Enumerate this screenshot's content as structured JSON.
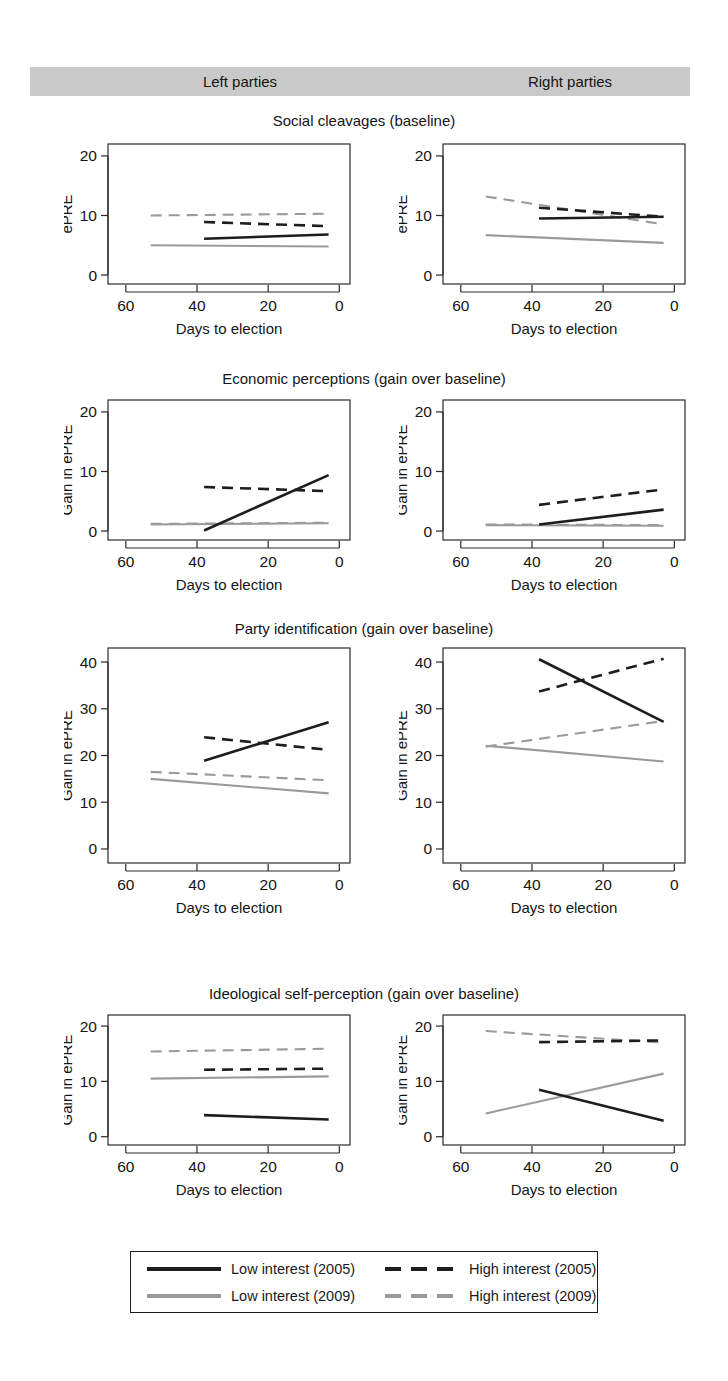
{
  "header": {
    "left_label": "Left parties",
    "right_label": "Right parties",
    "band_color": "#c9c9c9"
  },
  "axis": {
    "xlabel": "Days to election",
    "xticks": [
      "60",
      "40",
      "20",
      "0"
    ],
    "xlim": [
      65,
      -3
    ]
  },
  "legend": {
    "items": [
      {
        "label": "Low interest (2005)",
        "style": "solid",
        "color": "#1d1d1d",
        "key": "low2005"
      },
      {
        "label": "High interest (2005)",
        "style": "dashed",
        "color": "#1d1d1d",
        "key": "high2005"
      },
      {
        "label": "Low interest (2009)",
        "style": "solid",
        "color": "#9a9a9a",
        "key": "low2009"
      },
      {
        "label": "High interest (2009)",
        "style": "dashed",
        "color": "#9a9a9a",
        "key": "high2009"
      }
    ]
  },
  "chart_data": [
    {
      "type": "line",
      "title": "Social cleavages (baseline)",
      "facet": "Left parties",
      "xlabel": "Days to election",
      "ylabel": "ePRE",
      "xlim": [
        65,
        -3
      ],
      "ylim": [
        -1.5,
        22
      ],
      "yticks": [
        0,
        10,
        20
      ],
      "xticks": [
        60,
        40,
        20,
        0
      ],
      "grid": false,
      "series": [
        {
          "name": "Low interest (2005)",
          "style": "solid",
          "color": "#1d1d1d",
          "x": [
            38,
            3
          ],
          "y": [
            6.1,
            6.8
          ]
        },
        {
          "name": "High interest (2005)",
          "style": "dashed",
          "color": "#1d1d1d",
          "x": [
            38,
            3
          ],
          "y": [
            8.9,
            8.2
          ]
        },
        {
          "name": "Low interest (2009)",
          "style": "solid",
          "color": "#9a9a9a",
          "x": [
            53,
            3
          ],
          "y": [
            5.0,
            4.8
          ]
        },
        {
          "name": "High interest (2009)",
          "style": "dashed",
          "color": "#9a9a9a",
          "x": [
            53,
            3
          ],
          "y": [
            10.0,
            10.3
          ]
        }
      ]
    },
    {
      "type": "line",
      "title": "Social cleavages (baseline)",
      "facet": "Right parties",
      "xlabel": "Days to election",
      "ylabel": "ePRE",
      "xlim": [
        65,
        -3
      ],
      "ylim": [
        -1.5,
        22
      ],
      "yticks": [
        0,
        10,
        20
      ],
      "xticks": [
        60,
        40,
        20,
        0
      ],
      "grid": false,
      "series": [
        {
          "name": "Low interest (2005)",
          "style": "solid",
          "color": "#1d1d1d",
          "x": [
            38,
            3
          ],
          "y": [
            9.5,
            9.8
          ]
        },
        {
          "name": "High interest (2005)",
          "style": "dashed",
          "color": "#1d1d1d",
          "x": [
            38,
            3
          ],
          "y": [
            11.3,
            9.8
          ]
        },
        {
          "name": "Low interest (2009)",
          "style": "solid",
          "color": "#9a9a9a",
          "x": [
            53,
            3
          ],
          "y": [
            6.7,
            5.4
          ]
        },
        {
          "name": "High interest (2009)",
          "style": "dashed",
          "color": "#9a9a9a",
          "x": [
            53,
            3
          ],
          "y": [
            13.2,
            8.5
          ]
        }
      ]
    },
    {
      "type": "line",
      "title": "Economic perceptions (gain over baseline)",
      "facet": "Left parties",
      "xlabel": "Days to election",
      "ylabel": "Gain in ePRE",
      "xlim": [
        65,
        -3
      ],
      "ylim": [
        -1.5,
        22
      ],
      "yticks": [
        0,
        10,
        20
      ],
      "xticks": [
        60,
        40,
        20,
        0
      ],
      "grid": false,
      "series": [
        {
          "name": "Low interest (2005)",
          "style": "solid",
          "color": "#1d1d1d",
          "x": [
            38,
            3
          ],
          "y": [
            0.1,
            9.4
          ]
        },
        {
          "name": "High interest (2005)",
          "style": "dashed",
          "color": "#1d1d1d",
          "x": [
            38,
            3
          ],
          "y": [
            7.4,
            6.7
          ]
        },
        {
          "name": "Low interest (2009)",
          "style": "solid",
          "color": "#9a9a9a",
          "x": [
            53,
            3
          ],
          "y": [
            1.1,
            1.3
          ]
        },
        {
          "name": "High interest (2009)",
          "style": "dashed",
          "color": "#9a9a9a",
          "x": [
            53,
            3
          ],
          "y": [
            1.2,
            1.4
          ]
        }
      ]
    },
    {
      "type": "line",
      "title": "Economic perceptions (gain over baseline)",
      "facet": "Right parties",
      "xlabel": "Days to election",
      "ylabel": "Gain in ePRE",
      "xlim": [
        65,
        -3
      ],
      "ylim": [
        -1.5,
        22
      ],
      "yticks": [
        0,
        10,
        20
      ],
      "xticks": [
        60,
        40,
        20,
        0
      ],
      "grid": false,
      "series": [
        {
          "name": "Low interest (2005)",
          "style": "solid",
          "color": "#1d1d1d",
          "x": [
            38,
            3
          ],
          "y": [
            1.1,
            3.6
          ]
        },
        {
          "name": "High interest (2005)",
          "style": "dashed",
          "color": "#1d1d1d",
          "x": [
            38,
            3
          ],
          "y": [
            4.4,
            7.0
          ]
        },
        {
          "name": "Low interest (2009)",
          "style": "solid",
          "color": "#9a9a9a",
          "x": [
            53,
            3
          ],
          "y": [
            1.0,
            0.9
          ]
        },
        {
          "name": "High interest (2009)",
          "style": "dashed",
          "color": "#9a9a9a",
          "x": [
            53,
            3
          ],
          "y": [
            1.1,
            1.0
          ]
        }
      ]
    },
    {
      "type": "line",
      "title": "Party identification (gain over baseline)",
      "facet": "Left parties",
      "xlabel": "Days to election",
      "ylabel": "Gain in ePRE",
      "xlim": [
        65,
        -3
      ],
      "ylim": [
        -3,
        43
      ],
      "yticks": [
        0,
        10,
        20,
        30,
        40
      ],
      "xticks": [
        60,
        40,
        20,
        0
      ],
      "grid": false,
      "series": [
        {
          "name": "Low interest (2005)",
          "style": "solid",
          "color": "#1d1d1d",
          "x": [
            38,
            3
          ],
          "y": [
            18.9,
            27.1
          ]
        },
        {
          "name": "High interest (2005)",
          "style": "dashed",
          "color": "#1d1d1d",
          "x": [
            38,
            3
          ],
          "y": [
            23.9,
            21.2
          ]
        },
        {
          "name": "Low interest (2009)",
          "style": "solid",
          "color": "#9a9a9a",
          "x": [
            53,
            3
          ],
          "y": [
            15.0,
            11.9
          ]
        },
        {
          "name": "High interest (2009)",
          "style": "dashed",
          "color": "#9a9a9a",
          "x": [
            53,
            3
          ],
          "y": [
            16.5,
            14.7
          ]
        }
      ]
    },
    {
      "type": "line",
      "title": "Party identification (gain over baseline)",
      "facet": "Right parties",
      "xlabel": "Days to election",
      "ylabel": "Gain in ePRE",
      "xlim": [
        65,
        -3
      ],
      "ylim": [
        -3,
        43
      ],
      "yticks": [
        0,
        10,
        20,
        30,
        40
      ],
      "xticks": [
        60,
        40,
        20,
        0
      ],
      "grid": false,
      "series": [
        {
          "name": "Low interest (2005)",
          "style": "solid",
          "color": "#1d1d1d",
          "x": [
            38,
            3
          ],
          "y": [
            40.6,
            27.2
          ]
        },
        {
          "name": "High interest (2005)",
          "style": "dashed",
          "color": "#1d1d1d",
          "x": [
            38,
            3
          ],
          "y": [
            33.7,
            40.7
          ]
        },
        {
          "name": "Low interest (2009)",
          "style": "solid",
          "color": "#9a9a9a",
          "x": [
            53,
            3
          ],
          "y": [
            22.1,
            18.7
          ]
        },
        {
          "name": "High interest (2009)",
          "style": "dashed",
          "color": "#9a9a9a",
          "x": [
            53,
            3
          ],
          "y": [
            21.9,
            27.4
          ]
        }
      ]
    },
    {
      "type": "line",
      "title": "Ideological self-perception (gain over baseline)",
      "facet": "Left parties",
      "xlabel": "Days to election",
      "ylabel": "Gain in ePRE",
      "xlim": [
        65,
        -3
      ],
      "ylim": [
        -1.5,
        22
      ],
      "yticks": [
        0,
        10,
        20
      ],
      "xticks": [
        60,
        40,
        20,
        0
      ],
      "grid": false,
      "series": [
        {
          "name": "Low interest (2005)",
          "style": "solid",
          "color": "#1d1d1d",
          "x": [
            38,
            3
          ],
          "y": [
            3.9,
            3.1
          ]
        },
        {
          "name": "High interest (2005)",
          "style": "dashed",
          "color": "#1d1d1d",
          "x": [
            38,
            3
          ],
          "y": [
            12.1,
            12.3
          ]
        },
        {
          "name": "Low interest (2009)",
          "style": "solid",
          "color": "#9a9a9a",
          "x": [
            53,
            3
          ],
          "y": [
            10.5,
            10.9
          ]
        },
        {
          "name": "High interest (2009)",
          "style": "dashed",
          "color": "#9a9a9a",
          "x": [
            53,
            3
          ],
          "y": [
            15.4,
            15.9
          ]
        }
      ]
    },
    {
      "type": "line",
      "title": "Ideological self-perception (gain over baseline)",
      "facet": "Right parties",
      "xlabel": "Days to election",
      "ylabel": "Gain in ePRE",
      "xlim": [
        65,
        -3
      ],
      "ylim": [
        -1.5,
        22
      ],
      "yticks": [
        0,
        10,
        20
      ],
      "xticks": [
        60,
        40,
        20,
        0
      ],
      "grid": false,
      "series": [
        {
          "name": "Low interest (2005)",
          "style": "solid",
          "color": "#1d1d1d",
          "x": [
            38,
            3
          ],
          "y": [
            8.5,
            2.9
          ]
        },
        {
          "name": "High interest (2005)",
          "style": "dashed",
          "color": "#1d1d1d",
          "x": [
            38,
            3
          ],
          "y": [
            17.1,
            17.4
          ]
        },
        {
          "name": "Low interest (2009)",
          "style": "solid",
          "color": "#9a9a9a",
          "x": [
            53,
            3
          ],
          "y": [
            4.2,
            11.4
          ]
        },
        {
          "name": "High interest (2009)",
          "style": "dashed",
          "color": "#9a9a9a",
          "x": [
            53,
            3
          ],
          "y": [
            19.1,
            17.0
          ]
        }
      ]
    }
  ],
  "rows": [
    {
      "title": "Social cleavages (baseline)",
      "title_top": 112,
      "plot_top": 144,
      "plot_height": 140
    },
    {
      "title": "Economic perceptions (gain over baseline)",
      "title_top": 370,
      "plot_top": 400,
      "plot_height": 140
    },
    {
      "title": "Party identification (gain over baseline)",
      "title_top": 620,
      "plot_top": 648,
      "plot_height": 215
    },
    {
      "title": "Ideological self-perception (gain over baseline)",
      "title_top": 985,
      "plot_top": 1015,
      "plot_height": 130
    }
  ]
}
